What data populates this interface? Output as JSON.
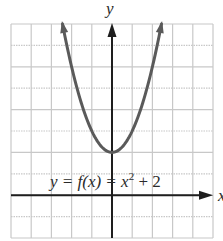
{
  "chart_data": {
    "type": "line",
    "title": "",
    "xlabel": "x",
    "ylabel": "y",
    "equation_label": "y = f(x) = x² + 2",
    "equation_parts": {
      "lhs": "y = f(x) = x",
      "exp": "2",
      "rhs": " + 2"
    },
    "xlim": [
      -5,
      5
    ],
    "ylim": [
      -2,
      8
    ],
    "grid": true,
    "grid_step": 1,
    "series": [
      {
        "name": "f(x) = x^2 + 2",
        "function": "x^2 + 2",
        "x": [
          -2.45,
          -2,
          -1.5,
          -1,
          -0.5,
          0,
          0.5,
          1,
          1.5,
          2,
          2.45
        ],
        "y": [
          8.0,
          6,
          4.25,
          3,
          2.25,
          2,
          2.25,
          3,
          4.25,
          6,
          8.0
        ],
        "color": "#5a5a5a",
        "arrows_at_ends": true
      }
    ],
    "vertex": {
      "x": 0,
      "y": 2
    }
  },
  "colors": {
    "grid": "#c8c8c8",
    "axis": "#1e1e1e",
    "curve": "#5a5a5a"
  }
}
